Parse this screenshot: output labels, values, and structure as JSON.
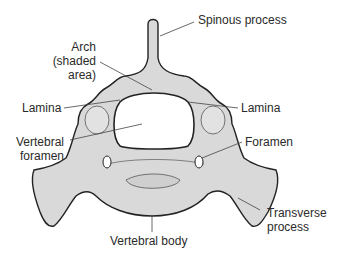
{
  "diagram": {
    "labels": {
      "spinous_process": "Spinous process",
      "arch_line1": "Arch",
      "arch_line2": "(shaded",
      "arch_line3": "area)",
      "lamina_left": "Lamina",
      "lamina_right": "Lamina",
      "vertebral_foramen_line1": "Vertebral",
      "vertebral_foramen_line2": "foramen",
      "foramen": "Foramen",
      "transverse_process_line1": "Transverse",
      "transverse_process_line2": "process",
      "vertebral_body": "Vertebral body"
    },
    "colors": {
      "bone_fill": "#d9d9d9",
      "bone_shade": "#c4c4c4",
      "outline": "#222222",
      "leader": "#444444",
      "text": "#2a2a2a",
      "background": "#ffffff"
    }
  }
}
